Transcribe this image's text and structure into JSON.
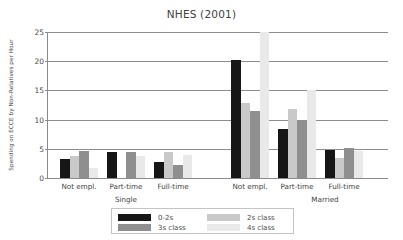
{
  "chart_data": {
    "type": "bar",
    "title": "NHES (2001)",
    "xlabel": "",
    "ylabel": "Spending on ECCE by Non-Relatives per Hour",
    "ylim": [
      0,
      25
    ],
    "yticks": [
      0,
      5,
      10,
      15,
      20,
      25
    ],
    "grid": true,
    "legend_position": "below-center",
    "group_labels": [
      "Single",
      "Married"
    ],
    "categories": [
      "Not empl.",
      "Part-time",
      "Full-time",
      "Not empl.",
      "Part-time",
      "Full-time"
    ],
    "series": [
      {
        "name": "0-2s",
        "color": "#161616",
        "values": [
          3.2,
          4.5,
          2.8,
          20.2,
          8.4,
          4.8
        ]
      },
      {
        "name": "2s class",
        "color": "#c9c9c9",
        "values": [
          3.8,
          0.0,
          4.5,
          12.9,
          11.9,
          3.4
        ]
      },
      {
        "name": "3s class",
        "color": "#8f8f8f",
        "values": [
          4.7,
          4.4,
          2.3,
          11.4,
          10.0,
          5.1
        ]
      },
      {
        "name": "4s class",
        "color": "#e9e9e9",
        "values": [
          1.8,
          3.8,
          4.0,
          26.0,
          15.0,
          4.7
        ]
      }
    ]
  },
  "legend": {
    "entries": [
      {
        "label": "0-2s",
        "color": "#161616"
      },
      {
        "label": "2s class",
        "color": "#c9c9c9"
      },
      {
        "label": "3s class",
        "color": "#8f8f8f"
      },
      {
        "label": "4s class",
        "color": "#e9e9e9"
      }
    ]
  },
  "axis": {
    "y_tick_labels": [
      "0",
      "5",
      "10",
      "15",
      "20",
      "25"
    ]
  }
}
